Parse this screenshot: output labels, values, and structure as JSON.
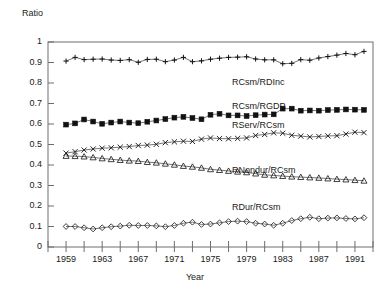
{
  "chart_data": {
    "type": "line",
    "title": "",
    "xlabel": "Year",
    "ylabel": "Ratio",
    "xlim": [
      1957,
      1993
    ],
    "ylim": [
      0,
      1
    ],
    "grid": false,
    "legend_position": "inline-right",
    "ytick_labels": [
      "0",
      "0.1",
      "0.2",
      "0.3",
      "0.4",
      "0.5",
      "0.6",
      "0.7",
      "0.8",
      "0.9",
      "1"
    ],
    "ytick_values": [
      0,
      0.1,
      0.2,
      0.3,
      0.4,
      0.5,
      0.6,
      0.7,
      0.8,
      0.9,
      1
    ],
    "xtick_labels": [
      "1959",
      "1963",
      "1967",
      "1971",
      "1975",
      "1979",
      "1983",
      "1987",
      "1991"
    ],
    "xtick_values": [
      1959,
      1963,
      1967,
      1971,
      1975,
      1979,
      1983,
      1987,
      1991
    ],
    "x": [
      1959,
      1960,
      1961,
      1962,
      1963,
      1964,
      1965,
      1966,
      1967,
      1968,
      1969,
      1970,
      1971,
      1972,
      1973,
      1974,
      1975,
      1976,
      1977,
      1978,
      1979,
      1980,
      1981,
      1982,
      1983,
      1984,
      1985,
      1986,
      1987,
      1988,
      1989,
      1990,
      1991,
      1992
    ],
    "series": [
      {
        "name": "RCsm/RDInc",
        "marker": "plus",
        "label": "RCsm/RDInc",
        "values": [
          0.907,
          0.925,
          0.914,
          0.916,
          0.917,
          0.912,
          0.91,
          0.914,
          0.901,
          0.915,
          0.916,
          0.904,
          0.912,
          0.925,
          0.904,
          0.908,
          0.916,
          0.921,
          0.925,
          0.926,
          0.928,
          0.917,
          0.913,
          0.913,
          0.894,
          0.896,
          0.914,
          0.911,
          0.922,
          0.929,
          0.936,
          0.944,
          0.938,
          0.954
        ]
      },
      {
        "name": "RCsm/RGDP",
        "marker": "square",
        "label": "RCsm/RGDP",
        "values": [
          0.597,
          0.603,
          0.622,
          0.612,
          0.601,
          0.607,
          0.612,
          0.607,
          0.604,
          0.611,
          0.617,
          0.624,
          0.631,
          0.635,
          0.629,
          0.623,
          0.645,
          0.65,
          0.642,
          0.642,
          0.639,
          0.643,
          0.646,
          0.647,
          0.675,
          0.675,
          0.665,
          0.666,
          0.665,
          0.668,
          0.669,
          0.671,
          0.67,
          0.669
        ]
      },
      {
        "name": "RServ/RCsm",
        "marker": "cross",
        "label": "RServ/RCsm",
        "values": [
          0.458,
          0.465,
          0.473,
          0.478,
          0.482,
          0.484,
          0.487,
          0.49,
          0.495,
          0.497,
          0.501,
          0.509,
          0.513,
          0.516,
          0.515,
          0.526,
          0.532,
          0.529,
          0.528,
          0.53,
          0.532,
          0.544,
          0.549,
          0.557,
          0.555,
          0.545,
          0.541,
          0.537,
          0.539,
          0.542,
          0.543,
          0.551,
          0.56,
          0.558
        ]
      },
      {
        "name": "RNondur/RCsm",
        "marker": "triangle",
        "label": "RNondur/RCsm",
        "values": [
          0.444,
          0.443,
          0.441,
          0.437,
          0.432,
          0.428,
          0.424,
          0.421,
          0.419,
          0.414,
          0.411,
          0.406,
          0.401,
          0.395,
          0.391,
          0.386,
          0.379,
          0.375,
          0.371,
          0.367,
          0.364,
          0.358,
          0.352,
          0.349,
          0.346,
          0.343,
          0.341,
          0.339,
          0.337,
          0.334,
          0.331,
          0.329,
          0.326,
          0.323
        ]
      },
      {
        "name": "RDur/RCsm",
        "marker": "diamond",
        "label": "RDur/RCsm",
        "values": [
          0.1,
          0.1,
          0.094,
          0.088,
          0.094,
          0.099,
          0.102,
          0.106,
          0.105,
          0.105,
          0.103,
          0.099,
          0.105,
          0.116,
          0.121,
          0.11,
          0.112,
          0.118,
          0.124,
          0.126,
          0.124,
          0.116,
          0.112,
          0.106,
          0.116,
          0.129,
          0.138,
          0.145,
          0.138,
          0.141,
          0.142,
          0.139,
          0.137,
          0.143
        ]
      }
    ],
    "series_label_positions": [
      {
        "name": "RCsm/RDInc",
        "x_px": 232,
        "y_px": 77
      },
      {
        "name": "RCsm/RGDP",
        "x_px": 232,
        "y_px": 101
      },
      {
        "name": "RServ/RCsm",
        "x_px": 232,
        "y_px": 120
      },
      {
        "name": "RNondur/RCsm",
        "x_px": 232,
        "y_px": 165
      },
      {
        "name": "RDur/RCsm",
        "x_px": 232,
        "y_px": 202
      }
    ]
  }
}
